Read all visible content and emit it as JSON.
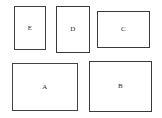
{
  "figure": {
    "type": "rectangle-packing-diagram",
    "width": 162,
    "height": 118,
    "background_color": "#ffffff",
    "default_border_color": "#3a3a3a",
    "default_fill_color": "#ffffff",
    "label_color": "#2b2b2b"
  },
  "rectangles": [
    {
      "label": "E",
      "x": 14,
      "y": 6,
      "width": 32,
      "height": 44,
      "border_width": 1.5,
      "border_color": "#3f3f3f",
      "fill_color": "#ffffff",
      "orientation": "portrait"
    },
    {
      "label": "D",
      "x": 56,
      "y": 6,
      "width": 34,
      "height": 47,
      "border_width": 1.5,
      "border_color": "#3a3a3a",
      "fill_color": "#ffffff",
      "orientation": "portrait"
    },
    {
      "label": "C",
      "x": 97,
      "y": 11,
      "width": 53,
      "height": 37,
      "border_width": 1.5,
      "border_color": "#3a3a3a",
      "fill_color": "#ffffff",
      "orientation": "landscape"
    },
    {
      "label": "A",
      "x": 12,
      "y": 63,
      "width": 66,
      "height": 48,
      "border_width": 1.5,
      "border_color": "#434343",
      "fill_color": "#ffffff",
      "orientation": "landscape"
    },
    {
      "label": "B",
      "x": 89,
      "y": 61,
      "width": 63,
      "height": 51,
      "border_width": 1.5,
      "border_color": "#3a3a3a",
      "fill_color": "#ffffff",
      "orientation": "landscape"
    }
  ]
}
